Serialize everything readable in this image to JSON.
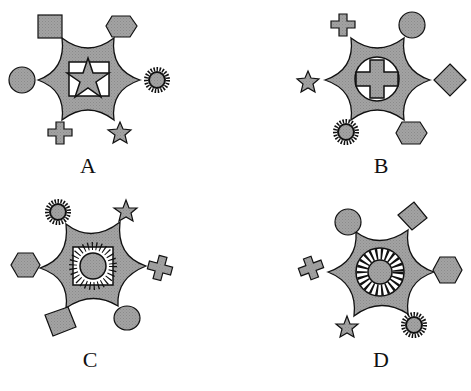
{
  "colors": {
    "fill": "#9a9a9a",
    "stroke": "#111111",
    "background": "#ffffff",
    "inner_white": "#ffffff"
  },
  "figures": [
    {
      "label": "A",
      "center": [
        88,
        78
      ],
      "center_symbol": "star-in-square",
      "tips": [
        {
          "position": "top-left",
          "shape": "square"
        },
        {
          "position": "top-right",
          "shape": "hexagon"
        },
        {
          "position": "left",
          "shape": "circle"
        },
        {
          "position": "right",
          "shape": "sun"
        },
        {
          "position": "bottom-left",
          "shape": "cross"
        },
        {
          "position": "bottom-right",
          "shape": "star"
        }
      ]
    },
    {
      "label": "B",
      "center": [
        378,
        78
      ],
      "center_symbol": "cross-in-circle",
      "tips": [
        {
          "position": "top-left",
          "shape": "cross"
        },
        {
          "position": "top-right",
          "shape": "circle"
        },
        {
          "position": "left",
          "shape": "star"
        },
        {
          "position": "right",
          "shape": "diamond"
        },
        {
          "position": "bottom-left",
          "shape": "sun"
        },
        {
          "position": "bottom-right",
          "shape": "hexagon"
        }
      ]
    },
    {
      "label": "C",
      "center": [
        90,
        268
      ],
      "center_symbol": "sun-in-square",
      "tips": [
        {
          "position": "top-left",
          "shape": "sun"
        },
        {
          "position": "top-right",
          "shape": "star"
        },
        {
          "position": "left",
          "shape": "hexagon"
        },
        {
          "position": "right",
          "shape": "cross"
        },
        {
          "position": "bottom-left",
          "shape": "diamond"
        },
        {
          "position": "bottom-right",
          "shape": "circle"
        }
      ]
    },
    {
      "label": "D",
      "center": [
        378,
        268
      ],
      "center_symbol": "sun-in-circle",
      "tips": [
        {
          "position": "top-left",
          "shape": "circle"
        },
        {
          "position": "top-right",
          "shape": "diamond"
        },
        {
          "position": "left",
          "shape": "cross"
        },
        {
          "position": "right",
          "shape": "hexagon"
        },
        {
          "position": "bottom-left",
          "shape": "star"
        },
        {
          "position": "bottom-right",
          "shape": "sun"
        }
      ]
    }
  ]
}
